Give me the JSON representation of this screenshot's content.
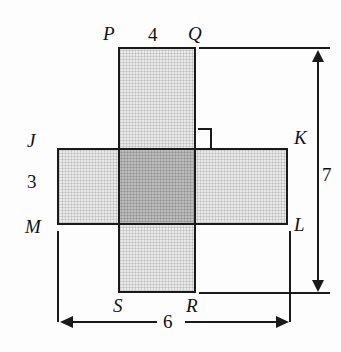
{
  "figure": {
    "vertices": {
      "P": "P",
      "Q": "Q",
      "R": "R",
      "S": "S",
      "J": "J",
      "K": "K",
      "L": "L",
      "M": "M"
    },
    "dimensions": {
      "top_width_PQ": "4",
      "left_height_JM": "3",
      "right_height_total": "7",
      "bottom_width_total": "6"
    },
    "markers": {
      "right_angle": "right-angle-marker"
    },
    "colors": {
      "stroke": "#1a1a1a",
      "fill_light": "#e9e9e9",
      "fill_overlap": "#bcbcbc",
      "background": "#fdfdfd"
    }
  },
  "chart_data": {
    "type": "diagram",
    "shapes": [
      {
        "name": "vertical-rectangle-PQRS",
        "vertices": [
          "P",
          "Q",
          "R",
          "S"
        ],
        "labeled_width": 4,
        "pixel_box": {
          "x": 118,
          "y": 47,
          "w": 78,
          "h": 246
        }
      },
      {
        "name": "horizontal-rectangle-JKLM",
        "vertices": [
          "J",
          "K",
          "L",
          "M"
        ],
        "labeled_height": 3,
        "pixel_box": {
          "x": 57,
          "y": 148,
          "w": 231,
          "h": 77
        }
      },
      {
        "name": "overlap-region",
        "pixel_box": {
          "x": 118,
          "y": 148,
          "w": 78,
          "h": 77
        }
      }
    ],
    "annotations": [
      {
        "label": "4",
        "orientation": "horizontal",
        "describes": "segment PQ, top edge of vertical rectangle"
      },
      {
        "label": "3",
        "orientation": "vertical",
        "describes": "segment JM, left edge height of horizontal rectangle"
      },
      {
        "label": "7",
        "orientation": "vertical",
        "describes": "overall height from line PQ down to line SR"
      },
      {
        "label": "6",
        "orientation": "horizontal",
        "describes": "overall width from line JM across to line KL"
      }
    ]
  }
}
